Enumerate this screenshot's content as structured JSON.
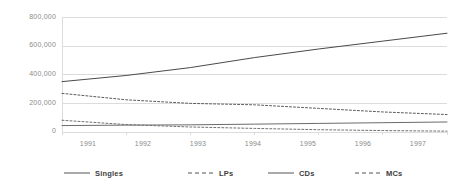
{
  "chart_data": {
    "type": "line",
    "title": "",
    "subtitle": "",
    "xlabel": "",
    "ylabel": "",
    "x": [
      1991,
      1992,
      1993,
      1994,
      1995,
      1996,
      1997
    ],
    "categories": [
      "1991",
      "1992",
      "1993",
      "1994",
      "1995",
      "1996",
      "1997"
    ],
    "xtick_labels": [
      "1991",
      "1992",
      "1993",
      "1994",
      "1995",
      "1996",
      "1997"
    ],
    "ytick_labels": [
      "800,000",
      "600,000",
      "400,000",
      "200,000",
      "0"
    ],
    "ytick_values": [
      800000,
      600000,
      400000,
      200000,
      0
    ],
    "ylim": [
      0,
      800000
    ],
    "xlim": [
      1991,
      1997
    ],
    "grid": "horizontal",
    "legend_position": "bottom",
    "series": [
      {
        "name": "Singles",
        "style": "solid",
        "color": "#6b6b6b",
        "values": [
          45000,
          48000,
          50000,
          55000,
          60000,
          65000,
          70000
        ]
      },
      {
        "name": "LPs",
        "style": "dashed",
        "color": "#5a5a5a",
        "values": [
          270000,
          225000,
          200000,
          190000,
          165000,
          140000,
          122000
        ]
      },
      {
        "name": "CDs",
        "style": "solid",
        "color": "#4a4a4a",
        "values": [
          352000,
          395000,
          450000,
          520000,
          580000,
          635000,
          690000
        ]
      },
      {
        "name": "MCs",
        "style": "dashed",
        "color": "#707070",
        "values": [
          82000,
          52000,
          35000,
          25000,
          16000,
          10000,
          6000
        ]
      }
    ]
  },
  "axes": {
    "ytick_labels": [
      "800,000",
      "600,000",
      "400,000",
      "200,000",
      "0"
    ],
    "xtick_labels": [
      "1991",
      "1992",
      "1993",
      "1994",
      "1995",
      "1996",
      "1997"
    ]
  },
  "legend": {
    "items": [
      {
        "label": "Singles",
        "style": "solid"
      },
      {
        "label": "LPs",
        "style": "dashed"
      },
      {
        "label": "CDs",
        "style": "solid"
      },
      {
        "label": "MCs",
        "style": "dashed"
      }
    ]
  },
  "colors": {
    "grid": "#dcdcdc",
    "axis_text": "#8a8a8a",
    "legend_text": "#3d3d3d",
    "background": "#ffffff"
  }
}
